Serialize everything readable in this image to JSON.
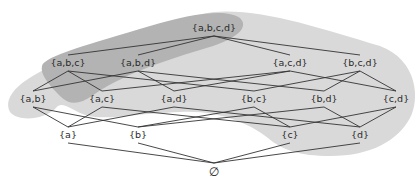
{
  "diagram": {
    "type": "hasse-diagram",
    "colors": {
      "background": "#ffffff",
      "light_region": "#d9d9d9",
      "dark_region": "#b3b3b3",
      "edge": "#333333",
      "label": "#2a2a2a"
    },
    "nodes": [
      {
        "id": "abcd",
        "label": "{a,b,c,d}",
        "x": 214,
        "y": 28
      },
      {
        "id": "abc",
        "label": "{a,b,c}",
        "x": 68,
        "y": 63
      },
      {
        "id": "abd",
        "label": "{a,b,d}",
        "x": 138,
        "y": 63
      },
      {
        "id": "acd",
        "label": "{a,c,d}",
        "x": 290,
        "y": 63
      },
      {
        "id": "bcd",
        "label": "{b,c,d}",
        "x": 360,
        "y": 63
      },
      {
        "id": "ab",
        "label": "{a,b}",
        "x": 33,
        "y": 99
      },
      {
        "id": "ac",
        "label": "{a,c}",
        "x": 102,
        "y": 99
      },
      {
        "id": "ad",
        "label": "{a,d}",
        "x": 174,
        "y": 99
      },
      {
        "id": "bc",
        "label": "{b,c}",
        "x": 254,
        "y": 99
      },
      {
        "id": "bd",
        "label": "{b,d}",
        "x": 324,
        "y": 99
      },
      {
        "id": "cd",
        "label": "{c,d}",
        "x": 396,
        "y": 99
      },
      {
        "id": "a",
        "label": "{a}",
        "x": 68,
        "y": 135
      },
      {
        "id": "b",
        "label": "{b}",
        "x": 138,
        "y": 135
      },
      {
        "id": "c",
        "label": "{c}",
        "x": 290,
        "y": 135
      },
      {
        "id": "d",
        "label": "{d}",
        "x": 360,
        "y": 135
      },
      {
        "id": "empty",
        "label": "∅",
        "x": 214,
        "y": 172
      }
    ],
    "edges": [
      [
        "abcd",
        "abc"
      ],
      [
        "abcd",
        "abd"
      ],
      [
        "abcd",
        "acd"
      ],
      [
        "abcd",
        "bcd"
      ],
      [
        "abc",
        "ab"
      ],
      [
        "abc",
        "ac"
      ],
      [
        "abc",
        "bc"
      ],
      [
        "abd",
        "ab"
      ],
      [
        "abd",
        "ad"
      ],
      [
        "abd",
        "bd"
      ],
      [
        "acd",
        "ac"
      ],
      [
        "acd",
        "ad"
      ],
      [
        "acd",
        "cd"
      ],
      [
        "bcd",
        "bc"
      ],
      [
        "bcd",
        "bd"
      ],
      [
        "bcd",
        "cd"
      ],
      [
        "ab",
        "a"
      ],
      [
        "ab",
        "b"
      ],
      [
        "ac",
        "a"
      ],
      [
        "ac",
        "c"
      ],
      [
        "ad",
        "a"
      ],
      [
        "ad",
        "d"
      ],
      [
        "bc",
        "b"
      ],
      [
        "bc",
        "c"
      ],
      [
        "bd",
        "b"
      ],
      [
        "bd",
        "d"
      ],
      [
        "cd",
        "c"
      ],
      [
        "cd",
        "d"
      ],
      [
        "a",
        "empty"
      ],
      [
        "b",
        "empty"
      ],
      [
        "c",
        "empty"
      ],
      [
        "d",
        "empty"
      ]
    ]
  }
}
